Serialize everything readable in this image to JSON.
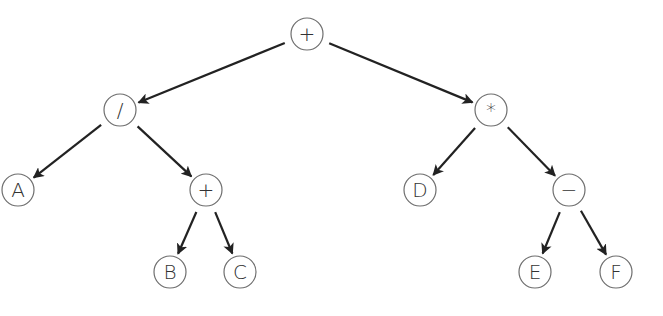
{
  "diagram": {
    "type": "expression-tree",
    "node_radius": 16,
    "colors": {
      "background": "#ffffff",
      "node_stroke": "#6e6e6e",
      "label": "#333333",
      "edge": "#222222"
    },
    "nodes": [
      {
        "id": "n0",
        "label": "+",
        "x": 307,
        "y": 34
      },
      {
        "id": "n1",
        "label": "/",
        "x": 120,
        "y": 110
      },
      {
        "id": "n2",
        "label": "*",
        "x": 491,
        "y": 110
      },
      {
        "id": "n3",
        "label": "A",
        "x": 18,
        "y": 190
      },
      {
        "id": "n4",
        "label": "+",
        "x": 206,
        "y": 190
      },
      {
        "id": "n5",
        "label": "D",
        "x": 420,
        "y": 190
      },
      {
        "id": "n6",
        "label": "−",
        "x": 569,
        "y": 190
      },
      {
        "id": "n7",
        "label": "B",
        "x": 170,
        "y": 272
      },
      {
        "id": "n8",
        "label": "C",
        "x": 240,
        "y": 272
      },
      {
        "id": "n9",
        "label": "E",
        "x": 535,
        "y": 272
      },
      {
        "id": "n10",
        "label": "F",
        "x": 616,
        "y": 272
      }
    ],
    "edges": [
      {
        "from": "n0",
        "to": "n1"
      },
      {
        "from": "n0",
        "to": "n2"
      },
      {
        "from": "n1",
        "to": "n3"
      },
      {
        "from": "n1",
        "to": "n4"
      },
      {
        "from": "n2",
        "to": "n5"
      },
      {
        "from": "n2",
        "to": "n6"
      },
      {
        "from": "n4",
        "to": "n7"
      },
      {
        "from": "n4",
        "to": "n8"
      },
      {
        "from": "n6",
        "to": "n9"
      },
      {
        "from": "n6",
        "to": "n10"
      }
    ]
  }
}
